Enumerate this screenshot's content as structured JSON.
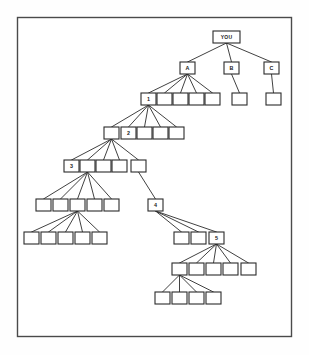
{
  "diagram": {
    "type": "hierarchy-tree",
    "canvas": {
      "width": 309,
      "height": 355
    },
    "frame": {
      "x": 17.5,
      "y": 17.5,
      "width": 274,
      "height": 319
    },
    "style": {
      "background_color": "#ffffff",
      "frame_stroke_color": "#4a4a4a",
      "node_fill_color": "#ffffff",
      "node_stroke_color": "#2b2b2b",
      "edge_stroke_color": "#2b2b2b",
      "label_color": "#1a1a1a"
    },
    "node_size": {
      "width": 15,
      "height": 12
    },
    "root_node_size": {
      "width": 27,
      "height": 12
    },
    "levels": [
      {
        "index": 0,
        "y": 31,
        "label": "root"
      },
      {
        "index": 1,
        "y": 62,
        "label": "first-generation"
      },
      {
        "index": 2,
        "y": 93,
        "label": "second-generation"
      },
      {
        "index": 3,
        "y": 127,
        "label": "third-generation"
      },
      {
        "index": 4,
        "y": 160,
        "label": "fourth-generation"
      },
      {
        "index": 5,
        "y": 199,
        "label": "fifth-generation"
      },
      {
        "index": 6,
        "y": 232,
        "label": "sixth-generation"
      },
      {
        "index": 7,
        "y": 263,
        "label": "seventh-generation"
      },
      {
        "index": 8,
        "y": 292,
        "label": "eighth-generation"
      }
    ],
    "nodes": [
      {
        "id": "you",
        "label": "YOU",
        "x": 213,
        "y": 31,
        "w": 27,
        "h": 12,
        "level": 0,
        "wide": true
      },
      {
        "id": "a",
        "label": "A",
        "x": 180,
        "y": 62,
        "w": 15,
        "h": 12,
        "level": 1
      },
      {
        "id": "b",
        "label": "B",
        "x": 224,
        "y": 62,
        "w": 15,
        "h": 12,
        "level": 1
      },
      {
        "id": "c",
        "label": "C",
        "x": 264,
        "y": 62,
        "w": 15,
        "h": 12,
        "level": 1
      },
      {
        "id": "n1",
        "label": "1",
        "x": 141,
        "y": 93,
        "w": 15,
        "h": 12,
        "level": 2
      },
      {
        "id": "a2",
        "label": "",
        "x": 157,
        "y": 93,
        "w": 15,
        "h": 12,
        "level": 2
      },
      {
        "id": "a3",
        "label": "",
        "x": 173,
        "y": 93,
        "w": 15,
        "h": 12,
        "level": 2
      },
      {
        "id": "a4",
        "label": "",
        "x": 189,
        "y": 93,
        "w": 15,
        "h": 12,
        "level": 2
      },
      {
        "id": "a5",
        "label": "",
        "x": 205,
        "y": 93,
        "w": 15,
        "h": 12,
        "level": 2
      },
      {
        "id": "b1",
        "label": "",
        "x": 232,
        "y": 93,
        "w": 15,
        "h": 12,
        "level": 2
      },
      {
        "id": "c1",
        "label": "",
        "x": 266,
        "y": 93,
        "w": 15,
        "h": 12,
        "level": 2
      },
      {
        "id": "p2",
        "label": "",
        "x": 104,
        "y": 127,
        "w": 15,
        "h": 12,
        "level": 3
      },
      {
        "id": "n2",
        "label": "2",
        "x": 121,
        "y": 127,
        "w": 15,
        "h": 12,
        "level": 3
      },
      {
        "id": "l3b",
        "label": "",
        "x": 137,
        "y": 127,
        "w": 15,
        "h": 12,
        "level": 3
      },
      {
        "id": "l3c",
        "label": "",
        "x": 153,
        "y": 127,
        "w": 15,
        "h": 12,
        "level": 3
      },
      {
        "id": "l3d",
        "label": "",
        "x": 169,
        "y": 127,
        "w": 15,
        "h": 12,
        "level": 3
      },
      {
        "id": "n3",
        "label": "3",
        "x": 64,
        "y": 160,
        "w": 15,
        "h": 12,
        "level": 4
      },
      {
        "id": "p3",
        "label": "",
        "x": 80,
        "y": 160,
        "w": 15,
        "h": 12,
        "level": 4
      },
      {
        "id": "l4c",
        "label": "",
        "x": 96,
        "y": 160,
        "w": 15,
        "h": 12,
        "level": 4
      },
      {
        "id": "l4d",
        "label": "",
        "x": 112,
        "y": 160,
        "w": 15,
        "h": 12,
        "level": 4
      },
      {
        "id": "l4e",
        "label": "",
        "x": 131,
        "y": 160,
        "w": 15,
        "h": 12,
        "level": 4
      },
      {
        "id": "l5a",
        "label": "",
        "x": 36,
        "y": 199,
        "w": 15,
        "h": 12,
        "level": 5
      },
      {
        "id": "l5b",
        "label": "",
        "x": 53,
        "y": 199,
        "w": 15,
        "h": 12,
        "level": 5
      },
      {
        "id": "p5",
        "label": "",
        "x": 70,
        "y": 199,
        "w": 15,
        "h": 12,
        "level": 5
      },
      {
        "id": "l5d",
        "label": "",
        "x": 87,
        "y": 199,
        "w": 15,
        "h": 12,
        "level": 5
      },
      {
        "id": "l5e",
        "label": "",
        "x": 104,
        "y": 199,
        "w": 15,
        "h": 12,
        "level": 5
      },
      {
        "id": "n4",
        "label": "4",
        "x": 148,
        "y": 199,
        "w": 15,
        "h": 12,
        "level": 5
      },
      {
        "id": "l6a",
        "label": "",
        "x": 24,
        "y": 232,
        "w": 15,
        "h": 12,
        "level": 6
      },
      {
        "id": "l6b",
        "label": "",
        "x": 41,
        "y": 232,
        "w": 15,
        "h": 12,
        "level": 6
      },
      {
        "id": "l6c",
        "label": "",
        "x": 58,
        "y": 232,
        "w": 15,
        "h": 12,
        "level": 6
      },
      {
        "id": "l6d",
        "label": "",
        "x": 75,
        "y": 232,
        "w": 15,
        "h": 12,
        "level": 6
      },
      {
        "id": "l6e",
        "label": "",
        "x": 92,
        "y": 232,
        "w": 15,
        "h": 12,
        "level": 6
      },
      {
        "id": "l6f",
        "label": "",
        "x": 174,
        "y": 232,
        "w": 15,
        "h": 12,
        "level": 6
      },
      {
        "id": "l6g",
        "label": "",
        "x": 191,
        "y": 232,
        "w": 15,
        "h": 12,
        "level": 6
      },
      {
        "id": "n5",
        "label": "5",
        "x": 209,
        "y": 232,
        "w": 15,
        "h": 12,
        "level": 6
      },
      {
        "id": "p7",
        "label": "",
        "x": 172,
        "y": 263,
        "w": 15,
        "h": 12,
        "level": 7
      },
      {
        "id": "l7b",
        "label": "",
        "x": 189,
        "y": 263,
        "w": 15,
        "h": 12,
        "level": 7
      },
      {
        "id": "l7c",
        "label": "",
        "x": 206,
        "y": 263,
        "w": 15,
        "h": 12,
        "level": 7
      },
      {
        "id": "l7d",
        "label": "",
        "x": 223,
        "y": 263,
        "w": 15,
        "h": 12,
        "level": 7
      },
      {
        "id": "l7e",
        "label": "",
        "x": 241,
        "y": 263,
        "w": 15,
        "h": 12,
        "level": 7
      },
      {
        "id": "l8a",
        "label": "",
        "x": 155,
        "y": 292,
        "w": 15,
        "h": 12,
        "level": 8
      },
      {
        "id": "l8b",
        "label": "",
        "x": 172,
        "y": 292,
        "w": 15,
        "h": 12,
        "level": 8
      },
      {
        "id": "l8c",
        "label": "",
        "x": 189,
        "y": 292,
        "w": 15,
        "h": 12,
        "level": 8
      },
      {
        "id": "l8d",
        "label": "",
        "x": 206,
        "y": 292,
        "w": 15,
        "h": 12,
        "level": 8
      }
    ],
    "edges": [
      {
        "from": "you",
        "to": "a"
      },
      {
        "from": "you",
        "to": "b"
      },
      {
        "from": "you",
        "to": "c"
      },
      {
        "from": "a",
        "to": "n1"
      },
      {
        "from": "a",
        "to": "a2"
      },
      {
        "from": "a",
        "to": "a3"
      },
      {
        "from": "a",
        "to": "a4"
      },
      {
        "from": "a",
        "to": "a5"
      },
      {
        "from": "b",
        "to": "b1"
      },
      {
        "from": "c",
        "to": "c1"
      },
      {
        "from": "n1",
        "to": "p2"
      },
      {
        "from": "n1",
        "to": "n2"
      },
      {
        "from": "n1",
        "to": "l3b"
      },
      {
        "from": "n1",
        "to": "l3c"
      },
      {
        "from": "n1",
        "to": "l3d"
      },
      {
        "from": "p2",
        "to": "n3"
      },
      {
        "from": "p2",
        "to": "p3"
      },
      {
        "from": "p2",
        "to": "l4c"
      },
      {
        "from": "p2",
        "to": "l4d"
      },
      {
        "from": "p2",
        "to": "l4e"
      },
      {
        "from": "p3",
        "to": "l5a"
      },
      {
        "from": "p3",
        "to": "l5b"
      },
      {
        "from": "p3",
        "to": "p5"
      },
      {
        "from": "p3",
        "to": "l5d"
      },
      {
        "from": "p3",
        "to": "l5e"
      },
      {
        "from": "l4e",
        "to": "n4"
      },
      {
        "from": "p5",
        "to": "l6a"
      },
      {
        "from": "p5",
        "to": "l6b"
      },
      {
        "from": "p5",
        "to": "l6c"
      },
      {
        "from": "p5",
        "to": "l6d"
      },
      {
        "from": "p5",
        "to": "l6e"
      },
      {
        "from": "n4",
        "to": "l6f"
      },
      {
        "from": "n4",
        "to": "l6g"
      },
      {
        "from": "n4",
        "to": "n5"
      },
      {
        "from": "n5",
        "to": "p7"
      },
      {
        "from": "n5",
        "to": "l7b"
      },
      {
        "from": "n5",
        "to": "l7c"
      },
      {
        "from": "n5",
        "to": "l7d"
      },
      {
        "from": "n5",
        "to": "l7e"
      },
      {
        "from": "p7",
        "to": "l8a"
      },
      {
        "from": "p7",
        "to": "l8b"
      },
      {
        "from": "p7",
        "to": "l8c"
      },
      {
        "from": "p7",
        "to": "l8d"
      }
    ]
  }
}
